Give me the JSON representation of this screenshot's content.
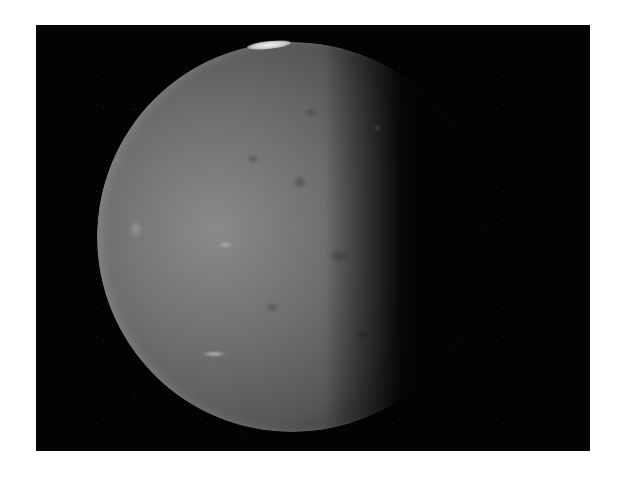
{
  "image": {
    "subject": "cratered moon, partially illuminated crescent-gibbous phase",
    "background_color": "#ffffff",
    "frame_color": "#030303",
    "surface_tone": "#6e6e6e",
    "highlight_color": "#f2f2f2"
  }
}
